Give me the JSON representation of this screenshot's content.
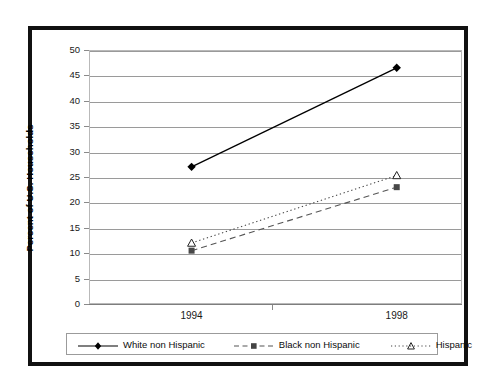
{
  "chart_data": {
    "type": "line",
    "title": "",
    "xlabel": "",
    "ylabel": "Percent of U.S. Households",
    "categories": [
      "1994",
      "1998"
    ],
    "x": [
      1994,
      1998
    ],
    "ylim": [
      0,
      50
    ],
    "y_ticks": [
      "0",
      "5",
      "10",
      "15",
      "20",
      "25",
      "30",
      "35",
      "40",
      "45",
      "50"
    ],
    "grid": "horizontal",
    "legend_position": "bottom",
    "series": [
      {
        "name": "White non Hispanic",
        "values": [
          27,
          46.5
        ],
        "line_style": "solid",
        "marker": "diamond",
        "color": "#000000"
      },
      {
        "name": "Black non Hispanic",
        "values": [
          10.5,
          23
        ],
        "line_style": "dashed",
        "marker": "square",
        "color": "#555555"
      },
      {
        "name": "Hispanic",
        "values": [
          12,
          25.3
        ],
        "line_style": "dotted",
        "marker": "triangle",
        "color": "#444444"
      }
    ]
  },
  "axes": {
    "y_title": "Percent of U.S. Households",
    "y_tick_0": "0",
    "y_tick_1": "5",
    "y_tick_2": "10",
    "y_tick_3": "15",
    "y_tick_4": "20",
    "y_tick_5": "25",
    "y_tick_6": "30",
    "y_tick_7": "35",
    "y_tick_8": "40",
    "y_tick_9": "45",
    "y_tick_10": "50",
    "x_tick_0": "1994",
    "x_tick_1": "1998"
  },
  "legend": {
    "item_0": "White non Hispanic",
    "item_1": "Black non Hispanic",
    "item_2": "Hispanic"
  },
  "colors": {
    "frame": "#111111",
    "gridline": "#9a9a9a",
    "plot_border": "#b9b9b9",
    "text": "#111111",
    "series_white": "#000000",
    "series_black": "#555555",
    "series_hispanic": "#444444"
  }
}
